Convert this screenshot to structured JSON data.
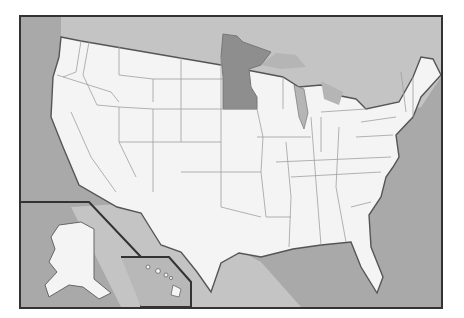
{
  "map": {
    "title": "",
    "highlighted_state": "Minnesota",
    "colors": {
      "land": "#f4f4f4",
      "water_near": "#c6c6c6",
      "water_ocean": "#a4a4a4",
      "highlight": "#8e8e8e",
      "border": "#9a9a9a",
      "coast": "#555555",
      "frame": "#333333"
    },
    "insets": [
      "Alaska",
      "Hawaii"
    ]
  }
}
